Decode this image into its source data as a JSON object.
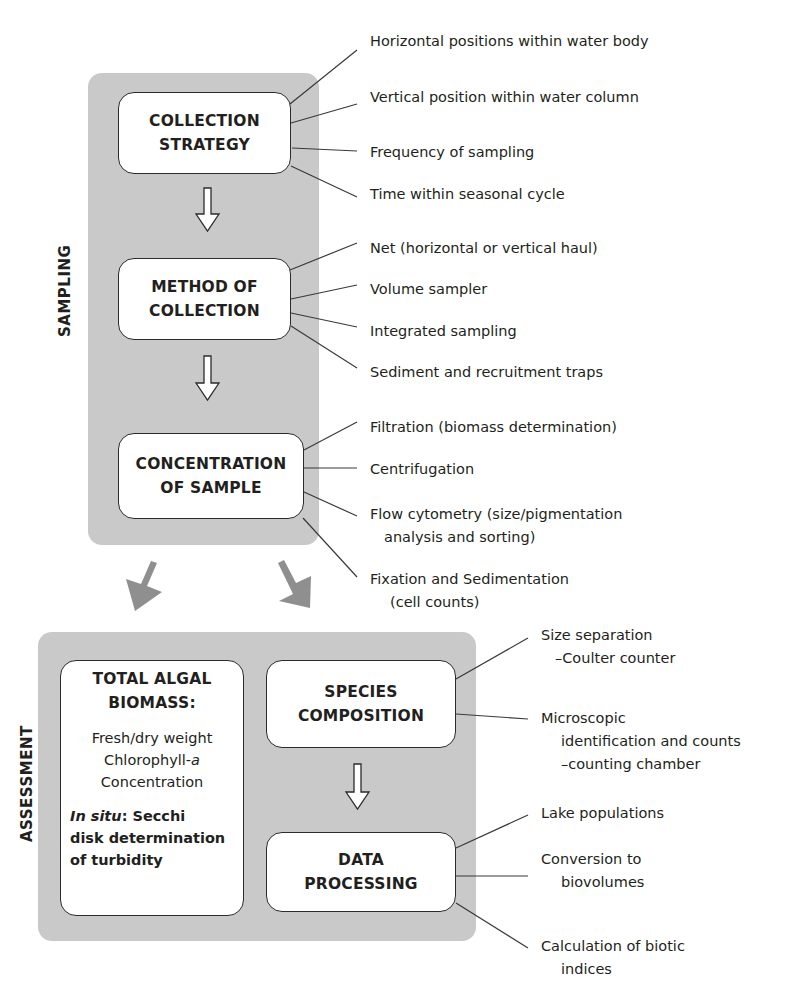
{
  "sections": {
    "sampling": {
      "label": "SAMPLING",
      "steps": [
        {
          "title_lines": [
            "COLLECTION",
            "STRATEGY"
          ],
          "notes": [
            "Horizontal positions within water body",
            "Vertical position within water column",
            "Frequency of sampling",
            "Time within seasonal cycle"
          ]
        },
        {
          "title_lines": [
            "METHOD OF",
            "COLLECTION"
          ],
          "notes": [
            "Net (horizontal or vertical haul)",
            "Volume sampler",
            "Integrated sampling",
            "Sediment and recruitment traps"
          ]
        },
        {
          "title_lines": [
            "CONCENTRATION",
            "OF SAMPLE"
          ],
          "notes": [
            {
              "line1": "Filtration (biomass determination)"
            },
            {
              "line1": "Centrifugation"
            },
            {
              "line1": "Flow cytometry (size/pigmentation",
              "line2": "analysis and sorting)"
            },
            {
              "line1": "Fixation and Sedimentation",
              "line2": "(cell counts)"
            }
          ]
        }
      ]
    },
    "assessment": {
      "label": "ASSESSMENT",
      "biomass": {
        "title_lines": [
          "TOTAL ALGAL",
          "BIOMASS:"
        ],
        "body_lines": [
          "Fresh/dry weight",
          "Chlorophyll-",
          "a",
          "Concentration"
        ],
        "insitu_italic": "In situ",
        "insitu_rest": ": Secchi",
        "insitu_lines": [
          "disk determination",
          "of turbidity"
        ]
      },
      "species": {
        "title_lines": [
          "SPECIES",
          "COMPOSITION"
        ],
        "notes": [
          {
            "line1": "Size separation",
            "line2": "–Coulter counter"
          },
          {
            "line1": "Microscopic",
            "line2": "identification and counts",
            "line3": "–counting chamber"
          }
        ]
      },
      "processing": {
        "title_lines": [
          "DATA",
          "PROCESSING"
        ],
        "notes": [
          {
            "line1": "Lake populations"
          },
          {
            "line1": "Conversion to",
            "line2": "biovolumes"
          },
          {
            "line1": "Calculation of biotic",
            "line2": "indices"
          }
        ]
      }
    }
  },
  "colors": {
    "panel": "#c9c9c9",
    "arrow_gray": "#8f8f8f",
    "line": "#3a3a3a"
  }
}
